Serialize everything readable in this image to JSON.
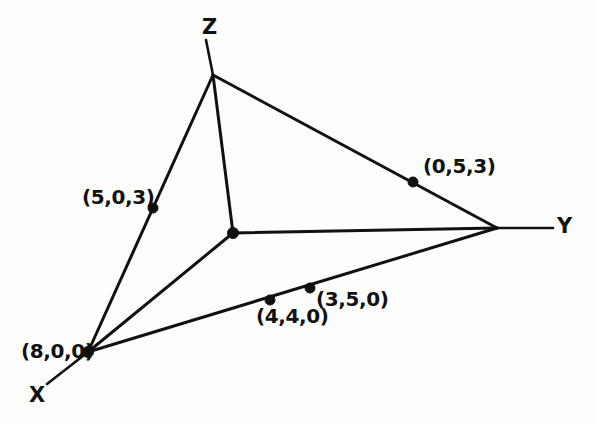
{
  "figure": {
    "background_color": "#fdfdfc",
    "ink_color": "#111111",
    "width": 596,
    "height": 425
  },
  "axes": [
    {
      "name": "x-axis",
      "label": "X",
      "label_x": 29,
      "label_y": 385,
      "from": [
        88,
        352
      ],
      "to": [
        47,
        384
      ]
    },
    {
      "name": "y-axis",
      "label": "Y",
      "label_x": 557,
      "label_y": 216,
      "from": [
        497,
        228
      ],
      "to": [
        553,
        228
      ]
    },
    {
      "name": "z-axis",
      "label": "Z",
      "label_x": 202,
      "label_y": 17,
      "from": [
        213,
        75
      ],
      "to": [
        206,
        40
      ]
    }
  ],
  "vertices": [
    {
      "name": "x-intercept",
      "coords_label": "(8,0,0)",
      "x": 88,
      "y": 352,
      "label_x": 21,
      "label_y": 341
    },
    {
      "name": "y-intercept",
      "coords_label": "",
      "x": 497,
      "y": 228,
      "label_x": 0,
      "label_y": 0
    },
    {
      "name": "z-intercept",
      "coords_label": "",
      "x": 213,
      "y": 75,
      "label_x": 0,
      "label_y": 0
    },
    {
      "name": "origin",
      "coords_label": "",
      "x": 233,
      "y": 233,
      "label_x": 0,
      "label_y": 0
    }
  ],
  "points": [
    {
      "name": "point-5-0-3",
      "coords_label": "(5,0,3)",
      "x": 153,
      "y": 208,
      "label_x": 82,
      "label_y": 187
    },
    {
      "name": "point-0-5-3",
      "coords_label": "(0,5,3)",
      "x": 413,
      "y": 182,
      "label_x": 423,
      "label_y": 156
    },
    {
      "name": "point-4-4-0",
      "coords_label": "(4,4,0)",
      "x": 270,
      "y": 300,
      "label_x": 256,
      "label_y": 306
    },
    {
      "name": "point-3-5-0",
      "coords_label": "(3,5,0)",
      "x": 310,
      "y": 288,
      "label_x": 316,
      "label_y": 289
    }
  ],
  "edges": [
    {
      "name": "edge-z-to-x",
      "from": [
        213,
        75
      ],
      "to": [
        88,
        352
      ]
    },
    {
      "name": "edge-z-to-y",
      "from": [
        213,
        75
      ],
      "to": [
        497,
        228
      ]
    },
    {
      "name": "edge-x-to-y",
      "from": [
        88,
        352
      ],
      "to": [
        497,
        228
      ]
    },
    {
      "name": "edge-origin-to-z",
      "from": [
        233,
        233
      ],
      "to": [
        213,
        75
      ]
    },
    {
      "name": "edge-origin-to-y",
      "from": [
        233,
        233
      ],
      "to": [
        497,
        228
      ]
    },
    {
      "name": "edge-origin-to-x",
      "from": [
        233,
        233
      ],
      "to": [
        88,
        352
      ]
    }
  ],
  "chart_data": {
    "type": "scatter",
    "title": "",
    "xlabel": "X",
    "ylabel": "Y",
    "zlabel": "Z",
    "annotations": [
      "(8,0,0)",
      "(5,0,3)",
      "(0,5,3)",
      "(4,4,0)",
      "(3,5,0)"
    ],
    "points_3d": [
      {
        "label": "(8,0,0)",
        "x": 8,
        "y": 0,
        "z": 0
      },
      {
        "label": "(5,0,3)",
        "x": 5,
        "y": 0,
        "z": 3
      },
      {
        "label": "(0,5,3)",
        "x": 0,
        "y": 5,
        "z": 3
      },
      {
        "label": "(4,4,0)",
        "x": 4,
        "y": 4,
        "z": 0
      },
      {
        "label": "(3,5,0)",
        "x": 3,
        "y": 5,
        "z": 0
      }
    ],
    "legend": [],
    "grid": false
  }
}
